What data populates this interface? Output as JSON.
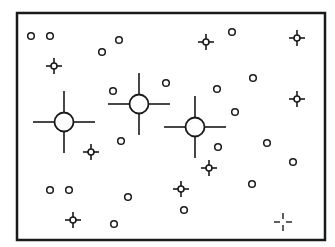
{
  "diagram": {
    "type": "star-field",
    "frame": {
      "x": 17,
      "y": 13,
      "width": 308,
      "height": 227,
      "stroke": "#1a1a1a"
    },
    "colors": {
      "ink": "#1a1a1a",
      "background": "#ffffff"
    },
    "small_circles": [
      {
        "x": 31,
        "y": 36
      },
      {
        "x": 50,
        "y": 36
      },
      {
        "x": 102,
        "y": 52
      },
      {
        "x": 119,
        "y": 40
      },
      {
        "x": 232,
        "y": 32
      },
      {
        "x": 253,
        "y": 78
      },
      {
        "x": 217,
        "y": 89
      },
      {
        "x": 113,
        "y": 91
      },
      {
        "x": 166,
        "y": 83
      },
      {
        "x": 235,
        "y": 112
      },
      {
        "x": 121,
        "y": 141
      },
      {
        "x": 218,
        "y": 147
      },
      {
        "x": 267,
        "y": 143
      },
      {
        "x": 293,
        "y": 162
      },
      {
        "x": 252,
        "y": 184
      },
      {
        "x": 50,
        "y": 190
      },
      {
        "x": 69,
        "y": 190
      },
      {
        "x": 128,
        "y": 197
      },
      {
        "x": 184,
        "y": 210
      },
      {
        "x": 114,
        "y": 224
      }
    ],
    "small_stars": [
      {
        "x": 54,
        "y": 66
      },
      {
        "x": 206,
        "y": 42
      },
      {
        "x": 297,
        "y": 38
      },
      {
        "x": 297,
        "y": 99
      },
      {
        "x": 91,
        "y": 152
      },
      {
        "x": 209,
        "y": 168
      },
      {
        "x": 181,
        "y": 189
      },
      {
        "x": 73,
        "y": 220
      }
    ],
    "large_stars": [
      {
        "x": 64,
        "y": 122
      },
      {
        "x": 139,
        "y": 104
      },
      {
        "x": 195,
        "y": 127
      }
    ],
    "broken_crosses": [
      {
        "x": 283,
        "y": 222
      }
    ]
  }
}
